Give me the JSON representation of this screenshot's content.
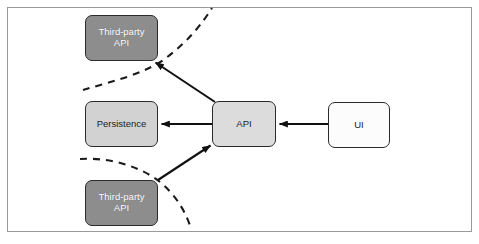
{
  "diagram": {
    "frame": {
      "visible": true,
      "border_color": "#9a9a9a"
    },
    "colors": {
      "third_party_fill": "#8d8d8d",
      "third_party_text": "#ffffff",
      "persistence_fill": "#d2d2d2",
      "api_fill": "#dcdcdc",
      "ui_fill": "#fcfcfc",
      "node_border": "#2b2b2b",
      "arrow": "#111111",
      "boundary_dash": "#1a1a1a"
    },
    "nodes": [
      {
        "id": "third-party-api-top",
        "label": "Third-party\nAPI",
        "fill": "#8d8d8d",
        "text_color": "#ffffff"
      },
      {
        "id": "persistence",
        "label": "Persistence",
        "fill": "#d2d2d2",
        "text_color": "#1b1b1b"
      },
      {
        "id": "third-party-api-bottom",
        "label": "Third-party\nAPI",
        "fill": "#8d8d8d",
        "text_color": "#ffffff"
      },
      {
        "id": "api",
        "label": "API",
        "fill": "#dcdcdc",
        "text_color": "#1b1b1b"
      },
      {
        "id": "ui",
        "label": "UI",
        "fill": "#fcfcfc",
        "text_color": "#1b1b1b"
      }
    ],
    "edges": [
      {
        "id": "ui-to-api",
        "from": "ui",
        "to": "third-party-api-top",
        "style": "solid",
        "arrow": "to"
      },
      {
        "id": "api-to-persistence",
        "from": "api",
        "to": "persistence",
        "style": "solid",
        "arrow": "to"
      },
      {
        "id": "api-to-third-party-top",
        "from": "api",
        "to": "third-party-api-top",
        "style": "solid",
        "arrow": "to"
      },
      {
        "id": "third-party-bottom-to-api",
        "from": "third-party-api-bottom",
        "to": "api",
        "style": "solid",
        "arrow": "to"
      }
    ],
    "boundaries": [
      {
        "id": "boundary-arc-top",
        "style": "dashed",
        "shape": "arc"
      },
      {
        "id": "boundary-arc-bottom",
        "style": "dashed",
        "shape": "arc"
      }
    ]
  }
}
